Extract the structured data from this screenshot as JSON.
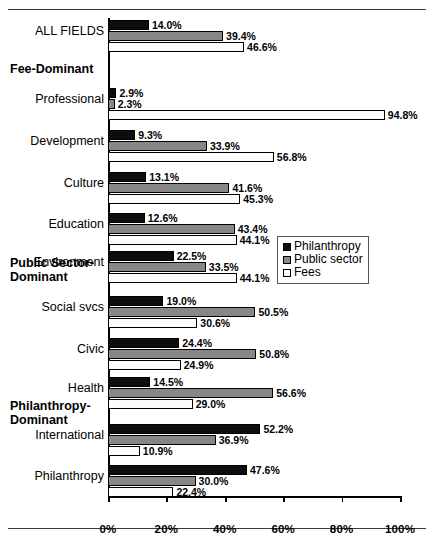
{
  "chart_data": {
    "type": "bar",
    "orientation": "horizontal",
    "title": "",
    "xlabel": "",
    "ylabel": "",
    "xlim": [
      0,
      100
    ],
    "xticks": [
      "0%",
      "20%",
      "40%",
      "60%",
      "80%",
      "100%"
    ],
    "xtick_values": [
      0,
      20,
      40,
      60,
      80,
      100
    ],
    "grid": false,
    "legend_position": "middle-right",
    "series": [
      {
        "name": "Philanthropy",
        "color": "#0d0d0d",
        "key": "philanthropy"
      },
      {
        "name": "Public sector",
        "color": "#878787",
        "key": "public"
      },
      {
        "name": "Fees",
        "color": "#ffffff",
        "key": "fees"
      }
    ],
    "categories": [
      "ALL FIELDS",
      "Professional",
      "Development",
      "Culture",
      "Education",
      "Environment",
      "Social svcs",
      "Civic",
      "Health",
      "International",
      "Philanthropy"
    ],
    "rows": [
      {
        "label": "ALL FIELDS",
        "group": null,
        "philanthropy": 14.0,
        "public": 39.4,
        "fees": 46.6,
        "labels": {
          "philanthropy": "14.0%",
          "public": "39.4%",
          "fees": "46.6%"
        }
      },
      {
        "label": "Professional",
        "group": "Fee-Dominant",
        "philanthropy": 2.9,
        "public": 2.3,
        "fees": 94.8,
        "labels": {
          "philanthropy": "2.9%",
          "public": "2.3%",
          "fees": "94.8%"
        }
      },
      {
        "label": "Development",
        "group": "Fee-Dominant",
        "philanthropy": 9.3,
        "public": 33.9,
        "fees": 56.8,
        "labels": {
          "philanthropy": "9.3%",
          "public": "33.9%",
          "fees": "56.8%"
        }
      },
      {
        "label": "Culture",
        "group": "Fee-Dominant",
        "philanthropy": 13.1,
        "public": 41.6,
        "fees": 45.3,
        "labels": {
          "philanthropy": "13.1%",
          "public": "41.6%",
          "fees": "45.3%"
        }
      },
      {
        "label": "Education",
        "group": "Fee-Dominant",
        "philanthropy": 12.6,
        "public": 43.4,
        "fees": 44.1,
        "labels": {
          "philanthropy": "12.6%",
          "public": "43.4%",
          "fees": "44.1%"
        }
      },
      {
        "label": "Environment",
        "group": "Fee-Dominant",
        "philanthropy": 22.5,
        "public": 33.5,
        "fees": 44.1,
        "labels": {
          "philanthropy": "22.5%",
          "public": "33.5%",
          "fees": "44.1%"
        }
      },
      {
        "label": "Social svcs",
        "group": "Public Sector-Dominant",
        "philanthropy": 19.0,
        "public": 50.5,
        "fees": 30.6,
        "labels": {
          "philanthropy": "19.0%",
          "public": "50.5%",
          "fees": "30.6%"
        }
      },
      {
        "label": "Civic",
        "group": "Public Sector-Dominant",
        "philanthropy": 24.4,
        "public": 50.8,
        "fees": 24.9,
        "labels": {
          "philanthropy": "24.4%",
          "public": "50.8%",
          "fees": "24.9%"
        }
      },
      {
        "label": "Health",
        "group": "Public Sector-Dominant",
        "philanthropy": 14.5,
        "public": 56.6,
        "fees": 29.0,
        "labels": {
          "philanthropy": "14.5%",
          "public": "56.6%",
          "fees": "29.0%"
        }
      },
      {
        "label": "International",
        "group": "Philanthropy-Dominant",
        "philanthropy": 52.2,
        "public": 36.9,
        "fees": 10.9,
        "labels": {
          "philanthropy": "52.2%",
          "public": "36.9%",
          "fees": "10.9%"
        }
      },
      {
        "label": "Philanthropy",
        "group": "Philanthropy-Dominant",
        "philanthropy": 47.6,
        "public": 30.0,
        "fees": 22.4,
        "labels": {
          "philanthropy": "47.6%",
          "public": "30.0%",
          "fees": "22.4%"
        }
      }
    ],
    "group_headings": [
      {
        "text": "Fee-Dominant",
        "lines": [
          "Fee-Dominant"
        ]
      },
      {
        "text": "Public Sector-Dominant",
        "lines": [
          "Public Sector-",
          "Dominant"
        ]
      },
      {
        "text": "Philanthropy-Dominant",
        "lines": [
          "Philanthropy-",
          "Dominant"
        ]
      }
    ],
    "legend": {
      "entries": [
        {
          "label": "Philanthropy",
          "swatch": "philanthropy"
        },
        {
          "label": "Public sector",
          "swatch": "public"
        },
        {
          "label": "Fees",
          "swatch": "fees"
        }
      ]
    }
  }
}
